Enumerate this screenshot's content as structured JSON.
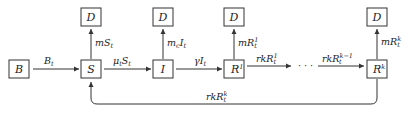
{
  "diagram": {
    "type": "compartmental-flow",
    "nodes": {
      "B": {
        "label": "B"
      },
      "S": {
        "label": "S"
      },
      "I": {
        "label": "I"
      },
      "R1": {
        "label": "R",
        "sup": "1"
      },
      "Rk": {
        "label": "R",
        "sup": "k"
      },
      "D_S": {
        "label": "D"
      },
      "D_I": {
        "label": "D"
      },
      "D_R1": {
        "label": "D"
      },
      "D_Rk": {
        "label": "D"
      }
    },
    "edges": {
      "B_S": {
        "main": "B",
        "sub": "t"
      },
      "S_I": {
        "main": "μ",
        "sub": "t",
        "main2": "S",
        "sub2": "t"
      },
      "I_R1": {
        "main": "γI",
        "sub": "t"
      },
      "R1_dots": {
        "main": "rkR",
        "sup": "1",
        "sub": "t"
      },
      "dots_Rk": {
        "main": "rkR",
        "sup": "k−1",
        "sub": "t"
      },
      "Rk_S": {
        "main": "rkR",
        "sup": "k",
        "sub": "t"
      },
      "S_D": {
        "main": "mS",
        "sub": "t"
      },
      "I_D": {
        "main": "m",
        "sub": "c",
        "main2": "I",
        "sub2": "t"
      },
      "R1_D": {
        "main": "mR",
        "sup": "1",
        "sub": "t"
      },
      "Rk_D": {
        "main": "mR",
        "sup": "k",
        "sub": "t"
      }
    },
    "ellipsis": "· · ·"
  }
}
